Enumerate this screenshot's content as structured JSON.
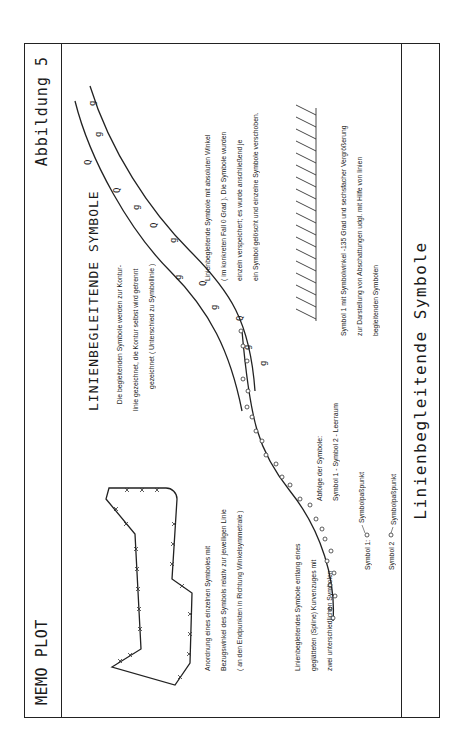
{
  "header": {
    "left": "MEMO PLOT",
    "right": "Abbildung 5"
  },
  "footer": {
    "title": "Linienbegleitende Symbole"
  },
  "main": {
    "title": "LINIENBEGLEITENDE SYMBOLE",
    "intro": [
      "Die begleitenden Symbole werden zur Kontur-",
      "linie gezeichnet, die Kontur selbst wird getrennt",
      "gezeichnet ( Unterschied zu Symbollinie )"
    ],
    "polygon_caption": [
      "Anordnung eines einzelnen Symboles mit",
      "Bezugswinkel des Symbols relativ zur jeweiligen Linie",
      "( an den Endpunkten in Richtung Winkelsymmetrale )"
    ],
    "spline_caption": [
      "Linienbegleitendes Symbole entlang eines",
      "geglätteten (Spline) Kurvenzuges mit",
      "zwei unterschiedlichen Symbolen"
    ],
    "sequence": {
      "label": "Abfolge der Symbole:",
      "value": "Symbol 1 - Symbol 2 - Leerraum"
    },
    "legend": [
      {
        "label": "Symbol 1:",
        "point": "Symbolpaßpunkt"
      },
      {
        "label": "Symbol 2",
        "point": "Symbolpaßpunkt"
      }
    ],
    "absolute_caption": [
      "Linienbegleitende Symbole mit absoluten Winkel",
      "( im konkreten Fall 0 Grad ). Die Symbole wurden",
      "einzeln verspeichert; es wurde anschließend je",
      "ein Symbol gelöscht und einzelne Symbole verschoben."
    ],
    "hatch_caption": [
      "Symbol 1  mit Symbolwinkel -135 Grad und sechsfacher Vergrößerung",
      "zur Darstellung von Abschattungen udgl. mit Hilfe von linien",
      "begleitenden Symbolen"
    ]
  }
}
